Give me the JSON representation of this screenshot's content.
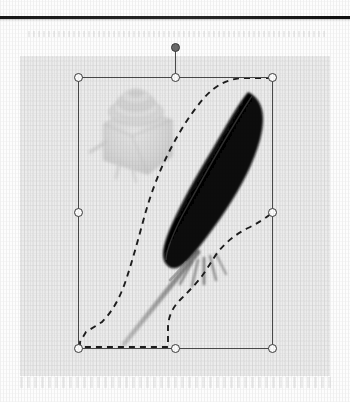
{
  "page": {
    "kind": "scanned-book-page",
    "background_color": "#fdfdfd",
    "rule_color": "#1a1a1a"
  },
  "canvas": {
    "label": "image-canvas",
    "background_color": "#ececec",
    "x": 20,
    "y": 56,
    "width": 310,
    "height": 320
  },
  "selection": {
    "label": "image-selection-frame",
    "frame_color": "#4a4a4a",
    "handle_fill": "#fbfbfb",
    "handle_stroke": "#3c3c3c",
    "rotation_handle_fill": "#6b6b6b",
    "bounds": {
      "left": 58,
      "top": 21,
      "width": 194,
      "height": 271
    },
    "handles": [
      {
        "name": "top-left",
        "x": 58,
        "y": 21
      },
      {
        "name": "top-middle",
        "x": 155,
        "y": 21
      },
      {
        "name": "top-right",
        "x": 252,
        "y": 21
      },
      {
        "name": "middle-left",
        "x": 58,
        "y": 156
      },
      {
        "name": "middle-right",
        "x": 252,
        "y": 156
      },
      {
        "name": "bottom-left",
        "x": 58,
        "y": 292
      },
      {
        "name": "bottom-middle",
        "x": 155,
        "y": 292
      },
      {
        "name": "bottom-right",
        "x": 252,
        "y": 292
      }
    ],
    "rotation_handle": {
      "name": "rotation",
      "x": 155,
      "y": -9
    }
  },
  "lasso": {
    "label": "marching-ants-selection-path",
    "stroke_color": "#1d1d1d",
    "dash_pattern": "6 5",
    "path": "M 252 22 L 226 22 C 210 22 196 28 184 42 C 170 58 158 78 148 98 C 138 118 130 140 124 162 C 118 184 112 206 106 224 C 100 242 92 256 82 266 L 66 276 L 60 286 L 60 291 L 148 291 L 148 272 C 148 262 152 252 160 244 C 168 236 176 228 182 220 C 188 212 192 204 198 196 C 206 186 216 178 228 172 C 238 167 246 162 252 157"
  },
  "artwork": {
    "label": "quill-and-inkwell-image",
    "feather": {
      "name": "black-feather-quill",
      "vane_color": "#0b0b0b",
      "shaft_color": "#8e8e8e",
      "rachis_highlight": "#6d6d6d"
    },
    "inkwell": {
      "name": "inkwell-bottle",
      "tint": "#c9c9c9",
      "x": 78,
      "y": 28,
      "width": 78,
      "height": 86
    }
  }
}
